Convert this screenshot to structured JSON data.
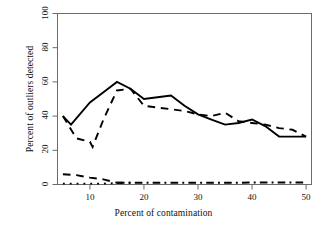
{
  "chart_data": {
    "type": "line",
    "title": "",
    "subtitle": "",
    "xlabel": "Percent of contamination",
    "ylabel": "Percent of outliers detected",
    "xlim": [
      4,
      51
    ],
    "ylim": [
      0,
      100
    ],
    "xticks": [
      10,
      20,
      30,
      40,
      50
    ],
    "yticks": [
      0,
      20,
      40,
      60,
      80,
      100
    ],
    "xtick_labels": [
      "10",
      "20",
      "30",
      "40",
      "50"
    ],
    "ytick_labels": [
      "0",
      "20",
      "40",
      "60",
      "80",
      "100"
    ],
    "grid": false,
    "legend": "none",
    "box": true,
    "series": [
      {
        "name": "solid",
        "style": "solid",
        "color": "#000000",
        "width": 1.9,
        "x": [
          5,
          6.5,
          10,
          12.5,
          15,
          17.5,
          20,
          22.5,
          25,
          27.5,
          30,
          32.5,
          35,
          37.5,
          40,
          42.5,
          45,
          47.5,
          50
        ],
        "y": [
          40,
          35,
          48,
          54,
          60,
          56,
          50,
          51,
          52,
          46,
          41,
          38,
          35,
          36,
          38,
          34,
          28,
          28,
          28
        ]
      },
      {
        "name": "dashed",
        "style": "dashed",
        "color": "#000000",
        "width": 1.9,
        "x": [
          5,
          7.5,
          10,
          10.5,
          12.5,
          15,
          17.5,
          20,
          22.5,
          25,
          27.5,
          30,
          32.5,
          35,
          37.5,
          40,
          42.5,
          45,
          47.5,
          50
        ],
        "y": [
          40,
          27,
          25,
          22,
          38,
          55,
          56,
          46,
          45,
          44,
          43,
          41,
          40,
          42,
          37,
          36,
          35,
          33,
          32,
          28
        ]
      },
      {
        "name": "dashed-low",
        "style": "dashed",
        "color": "#000000",
        "width": 1.9,
        "x": [
          5,
          7.5,
          10,
          12.5,
          15,
          17.5
        ],
        "y": [
          6,
          5.5,
          4,
          3,
          1,
          1
        ]
      },
      {
        "name": "dotted",
        "style": "dotted",
        "color": "#000000",
        "width": 1.9,
        "x": [
          5,
          7.5,
          10,
          12.5,
          15
        ],
        "y": [
          0.5,
          0.5,
          0.5,
          0.5,
          0.8
        ]
      },
      {
        "name": "dash-dot",
        "style": "dashdot",
        "color": "#000000",
        "width": 1.9,
        "x": [
          15,
          17.5,
          20,
          22.5,
          25,
          27.5,
          30,
          32.5,
          35,
          37.5,
          40,
          42.5,
          45,
          47.5,
          50
        ],
        "y": [
          1,
          1,
          1,
          1,
          1,
          1,
          1,
          1,
          1,
          1,
          1.2,
          1.2,
          1.2,
          1.2,
          1.2
        ]
      }
    ]
  },
  "figure": {
    "background_color": "#ffffff",
    "axis_color": "#6b6b6b",
    "line_color": "#000000"
  }
}
